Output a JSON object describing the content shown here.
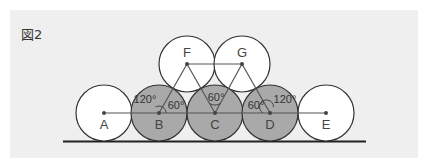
{
  "figure": {
    "label": "図2"
  },
  "colors": {
    "background": "#efefef",
    "circle_white": "#ffffff",
    "circle_gray": "#a9a9a9",
    "stroke": "#333333",
    "line": "#555555"
  },
  "circles": [
    {
      "id": "A",
      "label": "A",
      "cx": 104,
      "cy": 113,
      "fill": "white"
    },
    {
      "id": "B",
      "label": "B",
      "cx": 159,
      "cy": 113,
      "fill": "gray"
    },
    {
      "id": "C",
      "label": "C",
      "cx": 215,
      "cy": 113,
      "fill": "gray"
    },
    {
      "id": "D",
      "label": "D",
      "cx": 270,
      "cy": 113,
      "fill": "gray"
    },
    {
      "id": "E",
      "label": "E",
      "cx": 326,
      "cy": 113,
      "fill": "white"
    },
    {
      "id": "F",
      "label": "F",
      "cx": 187,
      "cy": 64,
      "fill": "white"
    },
    {
      "id": "G",
      "label": "G",
      "cx": 242,
      "cy": 64,
      "fill": "white"
    }
  ],
  "angles": {
    "b_120": "120°",
    "b_60": "60°",
    "c_60": "60°",
    "d_60": "60°",
    "d_120": "120°"
  }
}
